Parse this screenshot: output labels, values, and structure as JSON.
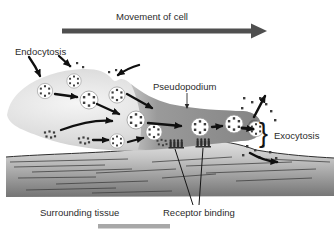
{
  "diagram": {
    "title": "Movement of cell",
    "labels": {
      "movement_of_cell": "Movement of cell",
      "endocytosis": "Endocytosis",
      "pseudopodium": "Pseudopodium",
      "exocytosis": "Exocytosis",
      "exocytosis_brace": "}",
      "surrounding_tissue": "Surrounding tissue",
      "receptor_binding": "Receptor binding"
    },
    "colors": {
      "background": "#ffffff",
      "text": "#2b2b2b",
      "movement_arrow": "#4f4f4f",
      "annotation_arrow": "#101010",
      "cell_body_light": "#f5f5f5",
      "cell_body_edge": "#b9b9b9",
      "pseudopodium": "#8d8d8d",
      "vesicle_fill": "#ffffff",
      "particle": "#3d3d3d",
      "tissue_top": "#e2e2e2",
      "tissue_bottom": "#747474",
      "tissue_line": "#3c3c3c",
      "scale_bar": "#a8a8a8"
    }
  }
}
